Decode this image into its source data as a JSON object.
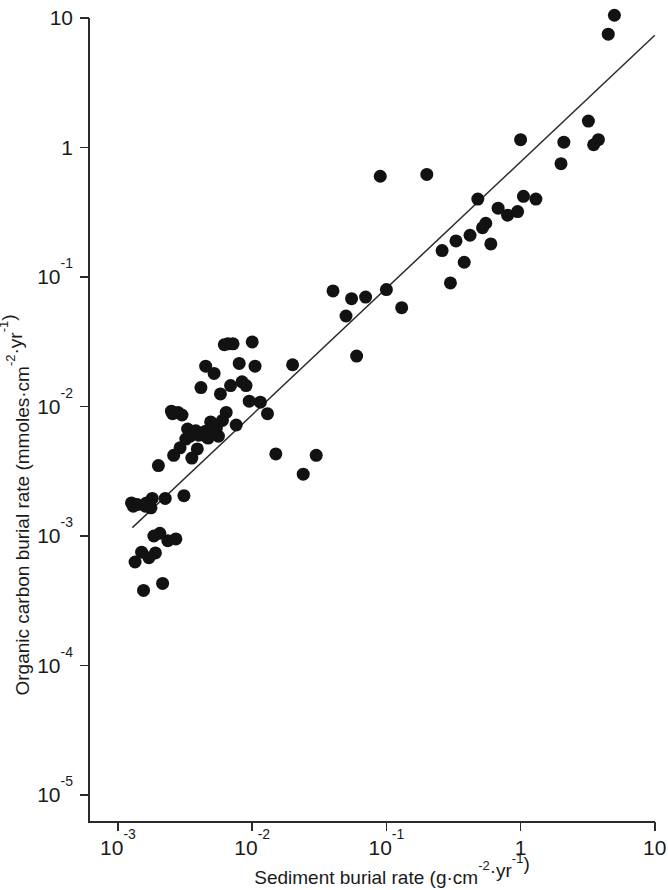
{
  "chart_data": {
    "type": "scatter",
    "title": "",
    "subtitle": "",
    "xlabel": "Sediment burial rate (g·cm⁻²·yr⁻¹)",
    "ylabel": "Organic carbon burial rate (mmoles·cm⁻²·yr⁻¹)",
    "xscale": "log",
    "yscale": "log",
    "xlim": [
      0.001,
      10
    ],
    "ylim": [
      1e-05,
      10
    ],
    "grid": false,
    "legend": null,
    "marker": {
      "shape": "circle",
      "color": "#121212",
      "size_px": 13,
      "filled": true
    },
    "xtick_labels": [
      "10⁻³",
      "10⁻²",
      "10⁻¹",
      "1",
      "10"
    ],
    "xtick_values": [
      0.001,
      0.01,
      0.1,
      1,
      10
    ],
    "ytick_labels": [
      "10",
      "1",
      "10⁻¹",
      "10⁻²",
      "10⁻³",
      "10⁻⁴",
      "10⁻⁵"
    ],
    "ytick_values": [
      10,
      1,
      0.1,
      0.01,
      0.001,
      0.0001,
      1e-05
    ],
    "xtick_mantissas": [
      "10",
      "10",
      "10",
      "1",
      "10"
    ],
    "xtick_exponents": [
      "-3",
      "-2",
      "-1",
      "",
      ""
    ],
    "ytick_mantissas": [
      "10",
      "1",
      "10",
      "10",
      "10",
      "10",
      "10"
    ],
    "ytick_exponents": [
      "",
      "",
      "-1",
      "-2",
      "-3",
      "-4",
      "-5"
    ],
    "x": [
      0.00126,
      0.0013,
      0.00134,
      0.00139,
      0.0015,
      0.00155,
      0.0016,
      0.00163,
      0.0017,
      0.00176,
      0.0018,
      0.00185,
      0.0019,
      0.002,
      0.00205,
      0.00215,
      0.00225,
      0.00235,
      0.0025,
      0.00255,
      0.0026,
      0.0027,
      0.0028,
      0.0029,
      0.003,
      0.0031,
      0.0032,
      0.0033,
      0.00345,
      0.00355,
      0.00365,
      0.0038,
      0.0039,
      0.004,
      0.00415,
      0.0043,
      0.00445,
      0.0045,
      0.0046,
      0.0047,
      0.0048,
      0.0049,
      0.005,
      0.0052,
      0.0054,
      0.0056,
      0.0058,
      0.006,
      0.0062,
      0.0064,
      0.0066,
      0.0069,
      0.0072,
      0.0076,
      0.008,
      0.0084,
      0.009,
      0.0095,
      0.01,
      0.0105,
      0.0115,
      0.013,
      0.015,
      0.02,
      0.024,
      0.03,
      0.04,
      0.05,
      0.055,
      0.06,
      0.07,
      0.09,
      0.1,
      0.13,
      0.2,
      0.26,
      0.3,
      0.33,
      0.38,
      0.42,
      0.48,
      0.52,
      0.55,
      0.6,
      0.68,
      0.8,
      0.95,
      1.0,
      1.05,
      1.3,
      2.0,
      2.1,
      3.2,
      3.5,
      3.8,
      4.5,
      5.0
    ],
    "y": [
      0.0018,
      0.0017,
      0.00063,
      0.00175,
      0.00075,
      0.00038,
      0.0017,
      0.0018,
      0.00068,
      0.00165,
      0.00195,
      0.001,
      0.00074,
      0.0035,
      0.00105,
      0.00043,
      0.00195,
      0.00092,
      0.0092,
      0.0088,
      0.0042,
      0.00095,
      0.009,
      0.0048,
      0.0086,
      0.00205,
      0.0056,
      0.0067,
      0.0059,
      0.004,
      0.0063,
      0.0065,
      0.0047,
      0.006,
      0.014,
      0.0061,
      0.0064,
      0.0205,
      0.0058,
      0.0057,
      0.0066,
      0.0076,
      0.0062,
      0.018,
      0.0068,
      0.0059,
      0.0125,
      0.0078,
      0.03,
      0.009,
      0.0305,
      0.0145,
      0.0305,
      0.0072,
      0.0215,
      0.0155,
      0.0145,
      0.011,
      0.0315,
      0.0205,
      0.0108,
      0.0088,
      0.0043,
      0.021,
      0.003,
      0.0042,
      0.078,
      0.05,
      0.068,
      0.0245,
      0.07,
      0.6,
      0.08,
      0.058,
      0.62,
      0.16,
      0.09,
      0.19,
      0.13,
      0.21,
      0.4,
      0.24,
      0.26,
      0.18,
      0.34,
      0.3,
      0.32,
      1.15,
      0.42,
      0.4,
      0.75,
      1.1,
      1.6,
      1.05,
      1.15,
      7.5,
      10.5
    ],
    "fit_line": {
      "label": "least-squares regression line",
      "x_start": 0.00128,
      "y_start": 0.00116,
      "x_end": 10.0,
      "y_end": 7.35,
      "slope": 0.96,
      "style": "solid",
      "color": "#2b2b2b"
    }
  }
}
